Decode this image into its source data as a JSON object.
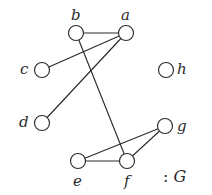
{
  "figure": {
    "width": 212,
    "height": 195,
    "background": "#ffffff",
    "ink_color": "#2b2b2b",
    "node_fill": "#ffffff",
    "node_radius": 7.5,
    "stroke_width": 1.15
  },
  "caption": {
    "separator": ":",
    "name": "G"
  },
  "graph": {
    "type": "undirected-graph",
    "node_count": 8,
    "edge_count": 7,
    "nodes": [
      {
        "id": "a",
        "label": "a",
        "x": 126,
        "y": 33,
        "label_x": 121,
        "label_y": 8,
        "label_position": "above"
      },
      {
        "id": "b",
        "label": "b",
        "x": 76,
        "y": 33,
        "label_x": 71,
        "label_y": 8,
        "label_position": "above"
      },
      {
        "id": "c",
        "label": "c",
        "x": 42,
        "y": 70,
        "label_x": 20,
        "label_y": 62,
        "label_position": "left"
      },
      {
        "id": "d",
        "label": "d",
        "x": 42,
        "y": 123,
        "label_x": 19,
        "label_y": 115,
        "label_position": "left"
      },
      {
        "id": "e",
        "label": "e",
        "x": 78,
        "y": 161,
        "label_x": 73,
        "label_y": 174,
        "label_position": "below"
      },
      {
        "id": "f",
        "label": "f",
        "x": 127,
        "y": 161,
        "label_x": 124,
        "label_y": 174,
        "label_position": "below"
      },
      {
        "id": "g",
        "label": "g",
        "x": 165,
        "y": 126,
        "label_x": 177,
        "label_y": 119,
        "label_position": "right"
      },
      {
        "id": "h",
        "label": "h",
        "x": 166,
        "y": 70,
        "label_x": 177,
        "label_y": 62,
        "label_position": "right"
      }
    ],
    "edges": [
      {
        "id": "edge-a-b",
        "source": "a",
        "target": "b",
        "x1": 126,
        "y1": 33,
        "x2": 76,
        "y2": 33
      },
      {
        "id": "edge-a-c",
        "source": "a",
        "target": "c",
        "x1": 126,
        "y1": 33,
        "x2": 42,
        "y2": 70
      },
      {
        "id": "edge-a-d",
        "source": "a",
        "target": "d",
        "x1": 126,
        "y1": 33,
        "x2": 42,
        "y2": 123
      },
      {
        "id": "edge-b-f",
        "source": "b",
        "target": "f",
        "x1": 76,
        "y1": 33,
        "x2": 127,
        "y2": 161
      },
      {
        "id": "edge-e-f",
        "source": "e",
        "target": "f",
        "x1": 78,
        "y1": 161,
        "x2": 127,
        "y2": 161
      },
      {
        "id": "edge-e-g",
        "source": "e",
        "target": "g",
        "x1": 78,
        "y1": 161,
        "x2": 165,
        "y2": 126
      },
      {
        "id": "edge-f-g",
        "source": "f",
        "target": "g",
        "x1": 127,
        "y1": 161,
        "x2": 165,
        "y2": 126
      }
    ],
    "isolated_nodes": [
      "h"
    ]
  }
}
